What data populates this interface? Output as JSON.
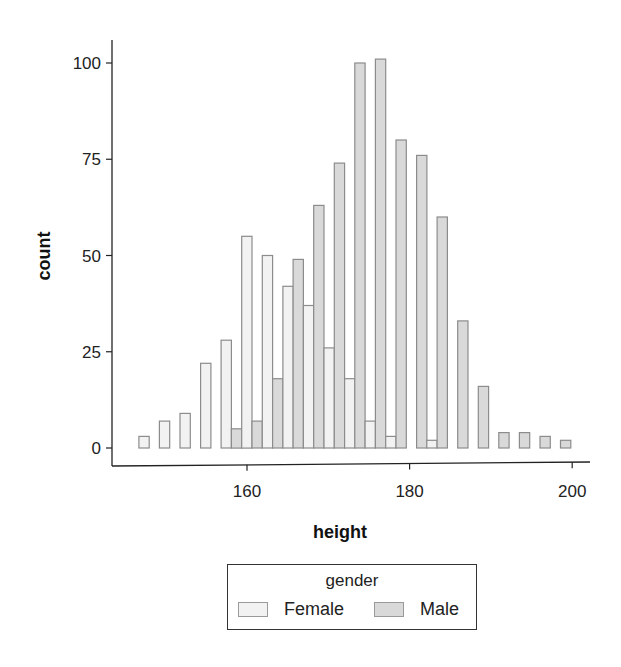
{
  "chart_data": {
    "type": "bar",
    "subtype": "dodged histogram",
    "title": "",
    "xlabel": "height",
    "ylabel": "count",
    "xlim": [
      145,
      201.5
    ],
    "ylim": [
      0,
      105
    ],
    "x_ticks": [
      160,
      180,
      200
    ],
    "y_ticks": [
      0,
      25,
      50,
      75,
      100
    ],
    "grid": false,
    "legend": {
      "title": "gender",
      "position": "bottom",
      "entries": [
        "Female",
        "Male"
      ]
    },
    "bin_width": 2.53,
    "bin_start": 146.7,
    "categories": [
      147.9,
      150.5,
      153.0,
      155.5,
      158.1,
      160.6,
      163.1,
      165.7,
      168.2,
      170.7,
      173.3,
      175.8,
      178.3,
      180.9,
      183.4,
      185.9,
      188.5,
      191.0,
      193.5,
      196.1,
      198.6
    ],
    "series": [
      {
        "name": "Female",
        "color": "#f2f2f2",
        "values": [
          3,
          7,
          9,
          22,
          28,
          55,
          50,
          42,
          37,
          26,
          18,
          7,
          3,
          0,
          2,
          0,
          0,
          0,
          0,
          0,
          0
        ]
      },
      {
        "name": "Male",
        "color": "#d9d9d9",
        "values": [
          0,
          0,
          0,
          0,
          5,
          7,
          18,
          49,
          63,
          74,
          100,
          101,
          80,
          76,
          60,
          33,
          16,
          4,
          4,
          3,
          2
        ]
      }
    ]
  },
  "colors": {
    "outline": "#8c8c8c",
    "axis": "#222222"
  },
  "legend": {
    "title": "gender",
    "items": [
      {
        "label": "Female",
        "color": "#f2f2f2"
      },
      {
        "label": "Male",
        "color": "#d9d9d9"
      }
    ]
  },
  "axes": {
    "x_title": "height",
    "y_title": "count"
  }
}
